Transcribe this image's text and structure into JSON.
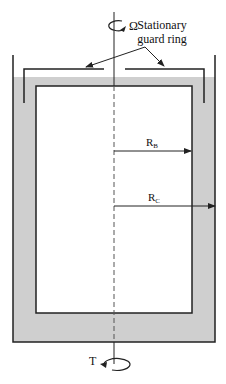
{
  "diagram": {
    "labels": {
      "omega": "Ω",
      "guard_ring_line1": "Stationary",
      "guard_ring_line2": "guard ring",
      "rb_main": "R",
      "rb_sub": "B",
      "rc_main": "R",
      "rc_sub": "C",
      "torque": "T"
    },
    "colors": {
      "fluid_fill": "#cfcfcf",
      "stroke": "#222222",
      "background": "#ffffff"
    },
    "components": [
      {
        "name": "outer-cup",
        "description": "Outer cylinder (cup) with radius R_C"
      },
      {
        "name": "inner-bob",
        "description": "Inner cylinder (bob) with radius R_B"
      },
      {
        "name": "fluid",
        "description": "Test fluid filling the annular gap"
      },
      {
        "name": "guard-ring",
        "description": "Stationary guard ring at top"
      },
      {
        "name": "axis",
        "description": "Rotation axis (dashed)"
      },
      {
        "name": "rotation-omega",
        "description": "Angular velocity Ω at top"
      },
      {
        "name": "torque-t",
        "description": "Torque T at bottom"
      }
    ]
  }
}
